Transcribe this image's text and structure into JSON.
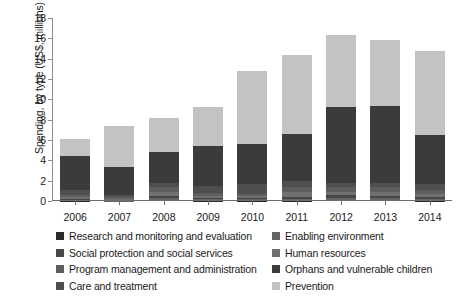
{
  "chart_data": {
    "type": "bar",
    "stacked": true,
    "title": "",
    "xlabel": "",
    "ylabel": "Spending, by type (US$, millions)",
    "categories": [
      "2006",
      "2007",
      "2008",
      "2009",
      "2010",
      "2011",
      "2012",
      "2013",
      "2014"
    ],
    "ylim": [
      0,
      18
    ],
    "yticks": [
      0,
      2,
      4,
      6,
      8,
      10,
      12,
      14,
      16,
      18
    ],
    "ytick_labels": [
      "0",
      "2",
      "4",
      "6",
      "8",
      "10",
      "12",
      "14",
      "16",
      "18"
    ],
    "grid": false,
    "legend_position": "below",
    "series": [
      {
        "name": "Prevention",
        "color": "#c3c3c3",
        "values": [
          1.65,
          4.05,
          3.35,
          3.8,
          7.15,
          7.8,
          7.05,
          6.45,
          8.35
        ]
      },
      {
        "name": "Orphans and vulnerable children",
        "color": "#3b3b3b",
        "values": [
          3.35,
          2.8,
          3.0,
          4.0,
          4.0,
          4.6,
          7.55,
          7.6,
          4.8
        ]
      },
      {
        "name": "Care and treatment",
        "color": "#4f4f4f",
        "values": [
          0.5,
          0.2,
          0.4,
          0.65,
          0.95,
          0.55,
          0.35,
          0.4,
          0.55
        ]
      },
      {
        "name": "Program management and administration",
        "color": "#5e5e5e",
        "values": [
          0.25,
          0.15,
          0.5,
          0.35,
          0.25,
          0.55,
          0.5,
          0.45,
          0.4
        ]
      },
      {
        "name": "Human resources",
        "color": "#707070",
        "values": [
          0.15,
          0.1,
          0.45,
          0.2,
          0.2,
          0.45,
          0.35,
          0.4,
          0.3
        ]
      },
      {
        "name": "Social protection and social services",
        "color": "#474747",
        "values": [
          0.1,
          0.05,
          0.15,
          0.1,
          0.1,
          0.2,
          0.25,
          0.2,
          0.2
        ]
      },
      {
        "name": "Enabling environment",
        "color": "#656565",
        "values": [
          0.05,
          0.05,
          0.2,
          0.1,
          0.1,
          0.15,
          0.2,
          0.2,
          0.15
        ]
      },
      {
        "name": "Research and monitoring and evaluation",
        "color": "#2b2b2b",
        "values": [
          0.05,
          0.0,
          0.1,
          0.05,
          0.05,
          0.05,
          0.1,
          0.1,
          0.05
        ]
      }
    ],
    "totals": [
      6.1,
      7.4,
      8.15,
      9.25,
      12.8,
      14.35,
      16.35,
      15.8,
      14.8
    ]
  },
  "axis": {
    "ylabel": "Spending, by type (US$, millions)"
  },
  "legend": {
    "rows": [
      {
        "left": {
          "label": "Research and monitoring and evaluation",
          "color": "#2b2b2b"
        },
        "right": {
          "label": "Enabling environment",
          "color": "#656565"
        }
      },
      {
        "left": {
          "label": "Social protection and social services",
          "color": "#474747"
        },
        "right": {
          "label": "Human resources",
          "color": "#707070"
        }
      },
      {
        "left": {
          "label": "Program management and administration",
          "color": "#5e5e5e"
        },
        "right": {
          "label": "Orphans and vulnerable children",
          "color": "#3b3b3b"
        }
      },
      {
        "left": {
          "label": "Care and treatment",
          "color": "#4f4f4f"
        },
        "right": {
          "label": "Prevention",
          "color": "#c3c3c3"
        }
      }
    ]
  }
}
